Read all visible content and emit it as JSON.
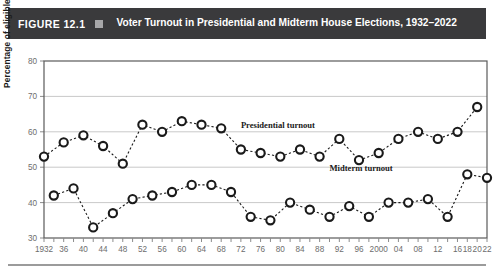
{
  "header": {
    "figure_number": "FIGURE 12.1",
    "bullet_icon": "square-bullet-icon",
    "title": "Voter Turnout in Presidential and Midterm House Elections, 1932–2022",
    "background_color": "#3a3a3c",
    "text_color": "#ffffff",
    "bullet_color": "#a7a7a9"
  },
  "chart_data": {
    "type": "line",
    "title": "Voter Turnout in Presidential and Midterm House Elections, 1932–2022",
    "xlabel": "",
    "ylabel": "Percentage of eligible electorate",
    "ylim": [
      30,
      80
    ],
    "yticks": [
      30,
      40,
      50,
      60,
      70,
      80
    ],
    "grid": true,
    "legend_position": "inline-annotation",
    "x": [
      1932,
      1934,
      1936,
      1938,
      1940,
      1942,
      1944,
      1946,
      1948,
      1950,
      1952,
      1954,
      1956,
      1958,
      1960,
      1962,
      1964,
      1966,
      1968,
      1970,
      1972,
      1974,
      1976,
      1978,
      1980,
      1982,
      1984,
      1986,
      1988,
      1990,
      1992,
      1994,
      1996,
      1998,
      2000,
      2002,
      2004,
      2006,
      2008,
      2010,
      2012,
      2014,
      2016,
      2018,
      2020,
      2022
    ],
    "xtick_labels": [
      "1932",
      "",
      "36",
      "",
      "40",
      "",
      "44",
      "",
      "48",
      "",
      "52",
      "",
      "56",
      "",
      "60",
      "",
      "64",
      "",
      "68",
      "",
      "72",
      "",
      "76",
      "",
      "80",
      "",
      "84",
      "",
      "88",
      "",
      "92",
      "",
      "96",
      "",
      "2000",
      "",
      "04",
      "",
      "08",
      "",
      "12",
      "",
      "16",
      "18",
      "20",
      "22"
    ],
    "xtick_labels_shown": [
      "1932",
      "36",
      "40",
      "44",
      "48",
      "52",
      "56",
      "60",
      "64",
      "68",
      "72",
      "76",
      "80",
      "84",
      "88",
      "92",
      "96",
      "2000",
      "04",
      "08",
      "12",
      "16",
      "18",
      "20",
      "22"
    ],
    "series": [
      {
        "name": "Presidential turnout",
        "label": "Presidential turnout",
        "marker": "open-circle",
        "linestyle": "dotted",
        "color": "#1a1a1a",
        "x": [
          1932,
          1936,
          1940,
          1944,
          1948,
          1952,
          1956,
          1960,
          1964,
          1968,
          1972,
          1976,
          1980,
          1984,
          1988,
          1992,
          1996,
          2000,
          2004,
          2008,
          2012,
          2016,
          2020
        ],
        "values": [
          53,
          57,
          59,
          56,
          51,
          62,
          60,
          63,
          62,
          61,
          55,
          54,
          53,
          55,
          53,
          58,
          52,
          54,
          58,
          60,
          58,
          60,
          67
        ]
      },
      {
        "name": "Midterm turnout",
        "label": "Midterm turnout",
        "marker": "open-circle",
        "linestyle": "dotted",
        "color": "#1a1a1a",
        "x": [
          1934,
          1938,
          1942,
          1946,
          1950,
          1954,
          1958,
          1962,
          1966,
          1970,
          1974,
          1978,
          1982,
          1986,
          1990,
          1994,
          1998,
          2002,
          2006,
          2010,
          2014,
          2018,
          2022
        ],
        "values": [
          42,
          44,
          33,
          37,
          41,
          42,
          43,
          45,
          45,
          43,
          36,
          35,
          40,
          38,
          36,
          39,
          36,
          40,
          40,
          41,
          36,
          48,
          47
        ]
      }
    ],
    "annotations": [
      {
        "text": "Presidential turnout",
        "x": 1972,
        "y": 61
      },
      {
        "text": "Midterm turnout",
        "x": 1990,
        "y": 49
      }
    ]
  }
}
